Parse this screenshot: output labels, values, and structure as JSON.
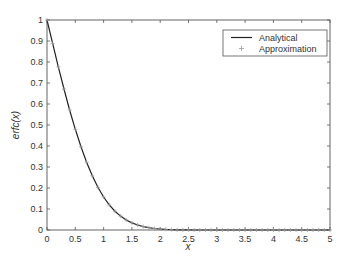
{
  "chart_data": {
    "type": "line",
    "title": "",
    "xlabel": "x",
    "ylabel": "erfc(x)",
    "xlim": [
      0,
      5
    ],
    "ylim": [
      0,
      1
    ],
    "grid": false,
    "legend_position": "upper right",
    "x_ticks": [
      "0",
      "0.5",
      "1",
      "1.5",
      "2",
      "2.5",
      "3",
      "3.5",
      "4",
      "4.5",
      "5"
    ],
    "y_ticks": [
      "0",
      "0.1",
      "0.2",
      "0.3",
      "0.4",
      "0.5",
      "0.6",
      "0.7",
      "0.8",
      "0.9",
      "1"
    ],
    "x": [
      0,
      0.1,
      0.2,
      0.3,
      0.4,
      0.5,
      0.6,
      0.7,
      0.8,
      0.9,
      1.0,
      1.1,
      1.2,
      1.3,
      1.4,
      1.5,
      1.6,
      1.7,
      1.8,
      1.9,
      2.0,
      2.1,
      2.2,
      2.3,
      2.4,
      2.5,
      2.6,
      2.7,
      2.8,
      2.9,
      3.0,
      3.1,
      3.2,
      3.3,
      3.4,
      3.5,
      3.6,
      3.7,
      3.8,
      3.9,
      4.0,
      4.1,
      4.2,
      4.3,
      4.4,
      4.5,
      4.6,
      4.7,
      4.8,
      4.9,
      5.0
    ],
    "series": [
      {
        "name": "Analytical",
        "style": "solid-line",
        "color": "#222222",
        "values": [
          1,
          0.8875,
          0.7773,
          0.6714,
          0.5716,
          0.4795,
          0.3961,
          0.3222,
          0.2579,
          0.2031,
          0.1573,
          0.1198,
          0.0897,
          0.066,
          0.0477,
          0.0339,
          0.0237,
          0.0162,
          0.0109,
          0.0072,
          0.0047,
          0.003,
          0.0019,
          0.0011,
          0.0007,
          0.0004,
          0.0002,
          0.0001,
          0.0001,
          0,
          0,
          0,
          0,
          0,
          0,
          0,
          0,
          0,
          0,
          0,
          0,
          0,
          0,
          0,
          0,
          0,
          0,
          0,
          0,
          0,
          0
        ]
      },
      {
        "name": "Approximation",
        "style": "plus-markers",
        "color": "#999999",
        "values": [
          1,
          0.8875,
          0.7773,
          0.6714,
          0.5716,
          0.4795,
          0.3961,
          0.3222,
          0.2579,
          0.2031,
          0.1573,
          0.1198,
          0.0897,
          0.066,
          0.0477,
          0.0339,
          0.0237,
          0.0162,
          0.0109,
          0.0072,
          0.0047,
          0.003,
          0.0019,
          0.0011,
          0.0007,
          0.0004,
          0.0002,
          0.0001,
          0.0001,
          0,
          0,
          0,
          0,
          0,
          0,
          0,
          0,
          0,
          0,
          0,
          0,
          0,
          0,
          0,
          0,
          0,
          0,
          0,
          0,
          0,
          0
        ]
      }
    ]
  }
}
